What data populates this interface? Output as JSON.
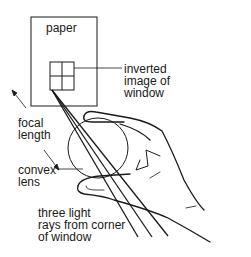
{
  "diagram": {
    "labels": {
      "paper": "paper",
      "inverted_image_line1": "inverted",
      "inverted_image_line2": "image of",
      "inverted_image_line3": "window",
      "focal_line1": "focal",
      "focal_line2": "length",
      "lens_line1": "convex",
      "lens_line2": "lens",
      "rays_line1": "three light",
      "rays_line2": "rays from corner",
      "rays_line3": "of window"
    },
    "colors": {
      "stroke": "#1a1a1a",
      "background": "#ffffff"
    }
  }
}
